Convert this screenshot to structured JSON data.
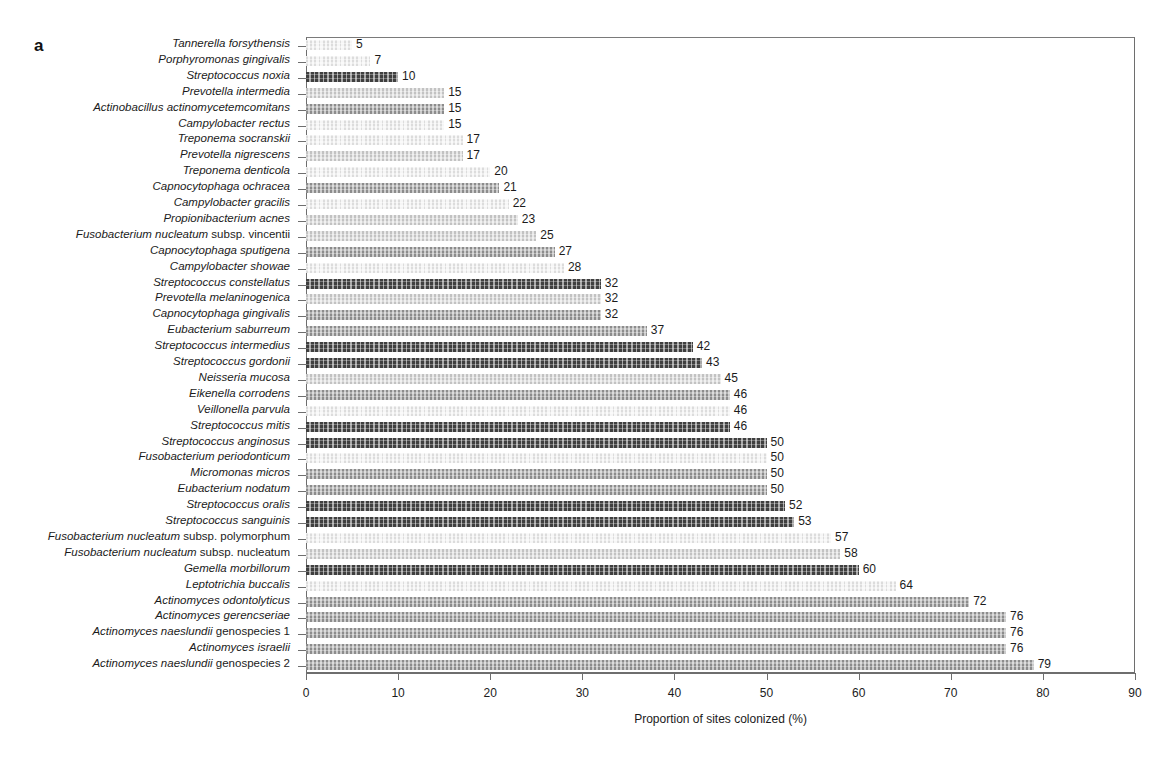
{
  "figure": {
    "panel_label": "a",
    "accent_colors": {
      "dark": "#3f3f3f",
      "mid": "#8c8c8c",
      "light": "#c2c2c2",
      "pale": "#dcdcdc",
      "axis": "#6e6e6e",
      "text": "#1b1b1b"
    }
  },
  "chart_data": {
    "type": "bar",
    "orientation": "horizontal",
    "title": "",
    "subtitle": "",
    "xlabel": "Proportion of sites colonized (%)",
    "ylabel": "",
    "xlim": [
      0,
      90
    ],
    "xticks": [
      0,
      10,
      20,
      30,
      40,
      50,
      60,
      70,
      80,
      90
    ],
    "xtick_labels": [
      "0",
      "10",
      "20",
      "30",
      "40",
      "50",
      "60",
      "70",
      "80",
      "90"
    ],
    "grid": false,
    "legend": null,
    "value_labels": true,
    "categories": [
      "Tannerella forsythensis",
      "Porphyromonas gingivalis",
      "Streptococcus noxia",
      "Prevotella intermedia",
      "Actinobacillus actinomycetemcomitans",
      "Campylobacter rectus",
      "Treponema socranskii",
      "Prevotella nigrescens",
      "Treponema denticola",
      "Capnocytophaga ochracea",
      "Campylobacter gracilis",
      "Propionibacterium acnes",
      "Fusobacterium nucleatum subsp. vincentii",
      "Capnocytophaga sputigena",
      "Campylobacter showae",
      "Streptococcus constellatus",
      "Prevotella melaninogenica",
      "Capnocytophaga gingivalis",
      "Eubacterium saburreum",
      "Streptococcus intermedius",
      "Streptococcus gordonii",
      "Neisseria mucosa",
      "Eikenella corrodens",
      "Veillonella parvula",
      "Streptococcus mitis",
      "Streptococcus anginosus",
      "Fusobacterium periodonticum",
      "Micromonas micros",
      "Eubacterium nodatum",
      "Streptococcus oralis",
      "Streptococcus sanguinis",
      "Fusobacterium nucleatum subsp. polymorphum",
      "Fusobacterium nucleatum subsp. nucleatum",
      "Gemella morbillorum",
      "Leptotrichia buccalis",
      "Actinomyces odontolyticus",
      "Actinomyces gerencseriae",
      "Actinomyces naeslundii genospecies 1",
      "Actinomyces israelii",
      "Actinomyces naeslundii genospecies 2"
    ],
    "values": [
      5,
      7,
      10,
      15,
      15,
      15,
      17,
      17,
      20,
      21,
      22,
      23,
      25,
      27,
      28,
      32,
      32,
      32,
      37,
      42,
      43,
      45,
      46,
      46,
      46,
      50,
      50,
      50,
      50,
      52,
      53,
      57,
      58,
      60,
      64,
      72,
      76,
      76,
      76,
      79
    ]
  },
  "rows": [
    {
      "label_italic": "Tannerella forsythensis",
      "label_plain": "",
      "value": 5,
      "shade": "pale"
    },
    {
      "label_italic": "Porphyromonas gingivalis",
      "label_plain": "",
      "value": 7,
      "shade": "pale"
    },
    {
      "label_italic": "Streptococcus noxia",
      "label_plain": "",
      "value": 10,
      "shade": "dark"
    },
    {
      "label_italic": "Prevotella intermedia",
      "label_plain": "",
      "value": 15,
      "shade": "light"
    },
    {
      "label_italic": "Actinobacillus actinomycetemcomitans",
      "label_plain": "",
      "value": 15,
      "shade": "mid"
    },
    {
      "label_italic": "Campylobacter rectus",
      "label_plain": "",
      "value": 15,
      "shade": "pale"
    },
    {
      "label_italic": "Treponema socranskii",
      "label_plain": "",
      "value": 17,
      "shade": "pale"
    },
    {
      "label_italic": "Prevotella nigrescens",
      "label_plain": "",
      "value": 17,
      "shade": "light"
    },
    {
      "label_italic": "Treponema denticola",
      "label_plain": "",
      "value": 20,
      "shade": "pale"
    },
    {
      "label_italic": "Capnocytophaga ochracea",
      "label_plain": "",
      "value": 21,
      "shade": "mid"
    },
    {
      "label_italic": "Campylobacter gracilis",
      "label_plain": "",
      "value": 22,
      "shade": "pale"
    },
    {
      "label_italic": "Propionibacterium acnes",
      "label_plain": "",
      "value": 23,
      "shade": "light"
    },
    {
      "label_italic": "Fusobacterium nucleatum",
      "label_plain": " subsp. vincentii",
      "value": 25,
      "shade": "light"
    },
    {
      "label_italic": "Capnocytophaga sputigena",
      "label_plain": "",
      "value": 27,
      "shade": "mid"
    },
    {
      "label_italic": "Campylobacter showae",
      "label_plain": "",
      "value": 28,
      "shade": "pale"
    },
    {
      "label_italic": "Streptococcus constellatus",
      "label_plain": "",
      "value": 32,
      "shade": "dark"
    },
    {
      "label_italic": "Prevotella melaninogenica",
      "label_plain": "",
      "value": 32,
      "shade": "light"
    },
    {
      "label_italic": "Capnocytophaga gingivalis",
      "label_plain": "",
      "value": 32,
      "shade": "mid"
    },
    {
      "label_italic": "Eubacterium saburreum",
      "label_plain": "",
      "value": 37,
      "shade": "mid"
    },
    {
      "label_italic": "Streptococcus intermedius",
      "label_plain": "",
      "value": 42,
      "shade": "dark"
    },
    {
      "label_italic": "Streptococcus gordonii",
      "label_plain": "",
      "value": 43,
      "shade": "dark"
    },
    {
      "label_italic": "Neisseria mucosa",
      "label_plain": "",
      "value": 45,
      "shade": "light"
    },
    {
      "label_italic": "Eikenella corrodens",
      "label_plain": "",
      "value": 46,
      "shade": "mid"
    },
    {
      "label_italic": "Veillonella parvula",
      "label_plain": "",
      "value": 46,
      "shade": "pale"
    },
    {
      "label_italic": "Streptococcus mitis",
      "label_plain": "",
      "value": 46,
      "shade": "dark"
    },
    {
      "label_italic": "Streptococcus anginosus",
      "label_plain": "",
      "value": 50,
      "shade": "dark"
    },
    {
      "label_italic": "Fusobacterium periodonticum",
      "label_plain": "",
      "value": 50,
      "shade": "pale"
    },
    {
      "label_italic": "Micromonas micros",
      "label_plain": "",
      "value": 50,
      "shade": "mid"
    },
    {
      "label_italic": "Eubacterium nodatum",
      "label_plain": "",
      "value": 50,
      "shade": "mid"
    },
    {
      "label_italic": "Streptococcus oralis",
      "label_plain": "",
      "value": 52,
      "shade": "dark"
    },
    {
      "label_italic": "Streptococcus sanguinis",
      "label_plain": "",
      "value": 53,
      "shade": "dark"
    },
    {
      "label_italic": "Fusobacterium nucleatum",
      "label_plain": " subsp. polymorphum",
      "value": 57,
      "shade": "pale"
    },
    {
      "label_italic": "Fusobacterium nucleatum",
      "label_plain": " subsp. nucleatum",
      "value": 58,
      "shade": "light"
    },
    {
      "label_italic": "Gemella morbillorum",
      "label_plain": "",
      "value": 60,
      "shade": "dark"
    },
    {
      "label_italic": "Leptotrichia buccalis",
      "label_plain": "",
      "value": 64,
      "shade": "pale"
    },
    {
      "label_italic": "Actinomyces odontolyticus",
      "label_plain": "",
      "value": 72,
      "shade": "mid"
    },
    {
      "label_italic": "Actinomyces gerencseriae",
      "label_plain": "",
      "value": 76,
      "shade": "mid"
    },
    {
      "label_italic": "Actinomyces naeslundii",
      "label_plain": " genospecies 1",
      "value": 76,
      "shade": "mid"
    },
    {
      "label_italic": "Actinomyces israelii",
      "label_plain": "",
      "value": 76,
      "shade": "mid"
    },
    {
      "label_italic": "Actinomyces naeslundii",
      "label_plain": " genospecies 2",
      "value": 79,
      "shade": "mid"
    }
  ]
}
